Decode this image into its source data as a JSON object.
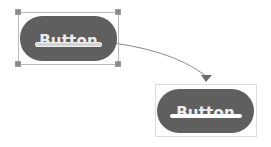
{
  "diagram": {
    "source": {
      "label": "Button",
      "state": "selected"
    },
    "target": {
      "label": "Button",
      "state": "result"
    },
    "connector": {
      "type": "curved-arrow",
      "direction": "source-to-target"
    },
    "colors": {
      "pill": "#5f5f5f",
      "label": "#ececec",
      "selection": "#b9b9b9",
      "handle": "#8a8a8a",
      "arrow": "#7a7a7a",
      "target_outline": "#dcdcdc"
    }
  }
}
